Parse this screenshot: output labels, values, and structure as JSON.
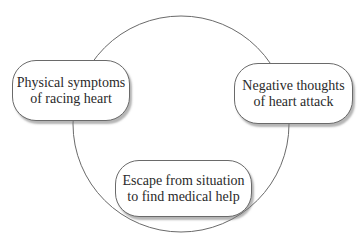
{
  "diagram": {
    "type": "cycle",
    "nodes": [
      {
        "id": "physical-symptoms",
        "lines": [
          "Physical symptoms",
          "of racing heart"
        ]
      },
      {
        "id": "negative-thoughts",
        "lines": [
          "Negative thoughts",
          "of heart attack"
        ]
      },
      {
        "id": "escape",
        "lines": [
          "Escape from situation",
          "to find medical help"
        ]
      }
    ],
    "edges": [
      {
        "from": "physical-symptoms",
        "to": "negative-thoughts"
      },
      {
        "from": "negative-thoughts",
        "to": "escape"
      },
      {
        "from": "escape",
        "to": "physical-symptoms"
      }
    ],
    "colors": {
      "line": "#6a6a6a",
      "text": "#2a2a2a",
      "box_fill": "#ffffff",
      "shadow": "#9a9a9a"
    }
  }
}
